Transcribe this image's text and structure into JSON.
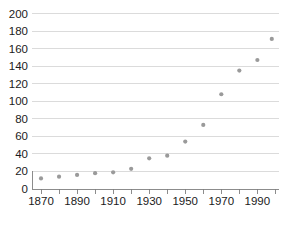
{
  "chart_data": {
    "type": "scatter",
    "title": "",
    "subtitle": "",
    "xlabel": "",
    "ylabel": "",
    "xlim": [
      1865,
      2002
    ],
    "ylim": [
      0,
      200
    ],
    "grid": true,
    "grid_axis": "y",
    "legend": false,
    "legend_position": "none",
    "marker_color": "#9a9a9a",
    "gridline_color": "#d2d2d2",
    "axis_color": "#808080",
    "text_color": "#1b1b1b",
    "x": [
      1870,
      1880,
      1890,
      1900,
      1910,
      1920,
      1930,
      1940,
      1950,
      1960,
      1970,
      1980,
      1990,
      1998
    ],
    "values": [
      12,
      14,
      16,
      18,
      19,
      23,
      35,
      38,
      54,
      73,
      108,
      135,
      147,
      171
    ],
    "series": [
      {
        "name": "",
        "values": [
          12,
          14,
          16,
          18,
          19,
          23,
          35,
          38,
          54,
          73,
          108,
          135,
          147,
          171
        ]
      }
    ],
    "yticks": [
      0,
      20,
      40,
      60,
      80,
      100,
      120,
      140,
      160,
      180,
      200
    ],
    "ytick_labels": [
      "0",
      "20",
      "40",
      "60",
      "80",
      "100",
      "120",
      "140",
      "160",
      "180",
      "200"
    ],
    "xticks": [
      1870,
      1880,
      1890,
      1900,
      1910,
      1920,
      1930,
      1940,
      1950,
      1960,
      1970,
      1980,
      1990,
      2000
    ],
    "xtick_labels_major": [
      "1870",
      "1890",
      "1910",
      "1930",
      "1950",
      "1970",
      "1990"
    ],
    "xticks_major": [
      1870,
      1890,
      1910,
      1930,
      1950,
      1970,
      1990
    ]
  }
}
